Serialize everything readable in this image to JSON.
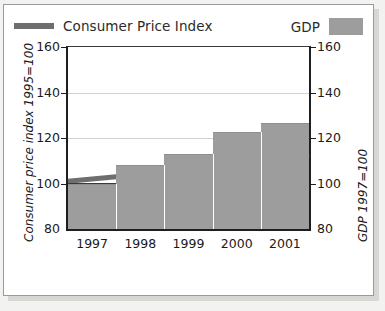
{
  "chart_data": {
    "type": "bar",
    "title": "",
    "subtitle": "",
    "xlabel": "",
    "ylabel": "Consumer price index 1995=100",
    "y2label": "GDP 1997=100",
    "categories": [
      "1997",
      "1998",
      "1999",
      "2000",
      "2001"
    ],
    "ylim": [
      80,
      160
    ],
    "y2lim": [
      80,
      160
    ],
    "yticks": [
      "80",
      "100",
      "120",
      "140",
      "160"
    ],
    "y2ticks": [
      "80",
      "100",
      "120",
      "140",
      "160"
    ],
    "grid": true,
    "legend_position": "top",
    "baseline": 100,
    "series": [
      {
        "name": "GDP",
        "type": "bar",
        "color": "#9d9d9d",
        "values": [
          100,
          108,
          113,
          122.5,
          126.5
        ]
      },
      {
        "name": "Consumer Price Index",
        "type": "line",
        "color": "#6e6e6e",
        "values": [
          102,
          104,
          105.5,
          108.5,
          111.5
        ]
      }
    ]
  },
  "legend": {
    "cpi_label": "Consumer Price Index",
    "gdp_label": "GDP",
    "cpi_color": "#6e6e6e",
    "gdp_color": "#9d9d9d"
  },
  "axes": {
    "left_title": "Consumer price index 1995=100",
    "right_title": "GDP 1997=100",
    "left_ticks": [
      "160",
      "140",
      "120",
      "100",
      "80"
    ],
    "right_ticks": [
      "160",
      "140",
      "120",
      "100",
      "80"
    ],
    "x_ticks": [
      "1997",
      "1998",
      "1999",
      "2000",
      "2001"
    ]
  }
}
